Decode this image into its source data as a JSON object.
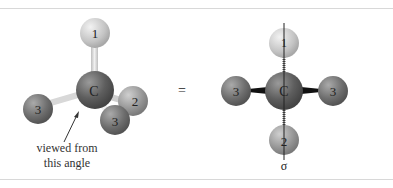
{
  "figure": {
    "left_model": {
      "center_atom": "C",
      "substituents": [
        "1",
        "2",
        "3",
        "3"
      ],
      "annotation": {
        "line1": "viewed from",
        "line2": "this angle"
      }
    },
    "operator": "=",
    "right_projection": {
      "center_atom": "C",
      "top": "1",
      "bottom": "2",
      "left": "3",
      "right": "3",
      "plane_label": "σ"
    }
  },
  "colors": {
    "carbon": "#6a6a6a",
    "atom1": "#d0d0d0",
    "atom2": "#9a9a9a",
    "atom3": "#777777",
    "bond": "#e0e0e0",
    "frame": "#d8d8d8"
  }
}
